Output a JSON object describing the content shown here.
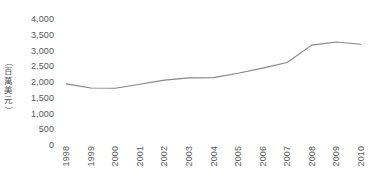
{
  "chart_data": {
    "type": "line",
    "title": "",
    "subtitle": "",
    "xlabel": "",
    "ylabel": "（百萬美元）",
    "categories": [
      "1998",
      "1999",
      "2000",
      "2001",
      "2002",
      "2003",
      "2004",
      "2005",
      "2006",
      "2007",
      "2008",
      "2009",
      "2010"
    ],
    "x": [
      1998,
      1999,
      2000,
      2001,
      2002,
      2003,
      2004,
      2005,
      2006,
      2007,
      2008,
      2009,
      2010
    ],
    "values": [
      1940,
      1810,
      1800,
      1930,
      2060,
      2130,
      2140,
      2280,
      2440,
      2620,
      3170,
      3270,
      3200
    ],
    "series": [
      {
        "name": "",
        "values": [
          1940,
          1810,
          1800,
          1930,
          2060,
          2130,
          2140,
          2280,
          2440,
          2620,
          3170,
          3270,
          3200
        ]
      }
    ],
    "ylim": [
      0,
      4000
    ],
    "yticks": [
      0,
      500,
      1000,
      1500,
      2000,
      2500,
      3000,
      3500,
      4000
    ],
    "ytick_labels": [
      "0",
      "500",
      "1,000",
      "1,500",
      "2,000",
      "2,500",
      "3,000",
      "3,500",
      "4,000"
    ],
    "grid": false,
    "legend": null,
    "legend_position": "none",
    "line_color": "#85858a",
    "text_color": "#58585a",
    "background": "#ffffff",
    "markers": false,
    "annotations": []
  },
  "axis": {
    "y_unit_caption": "（百萬美元）",
    "y_unit_chars": [
      "（",
      "百",
      "萬",
      "美",
      "元",
      "）"
    ]
  }
}
